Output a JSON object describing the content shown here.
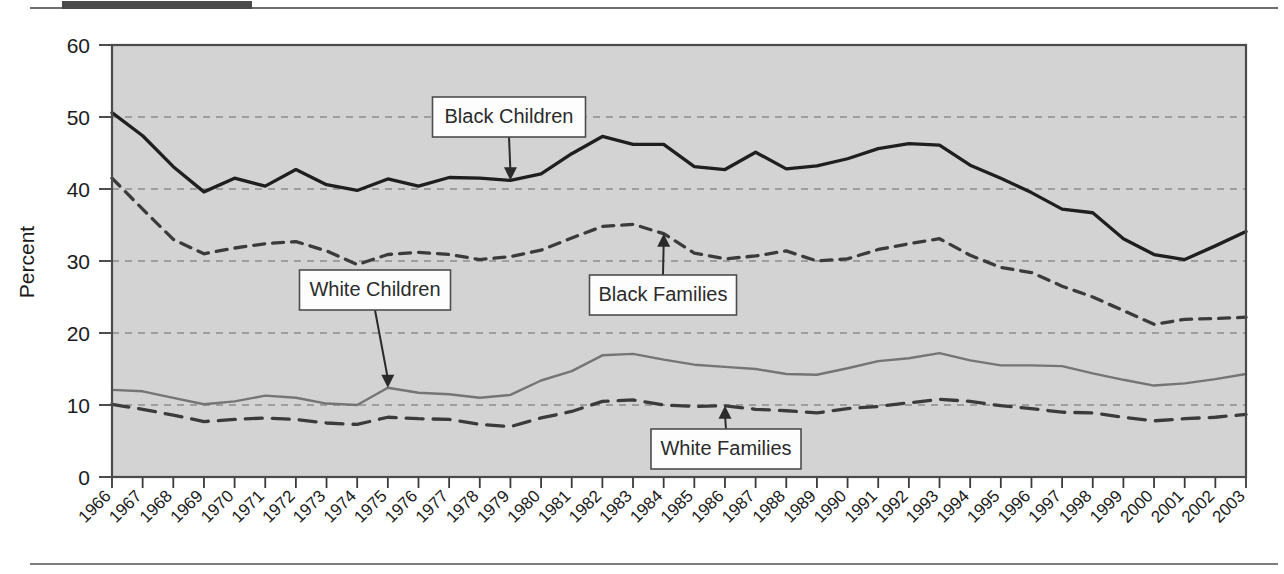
{
  "figure": {
    "percent_axis_label": "Percent",
    "background_color": "#d3d3d3",
    "frame_color": "#4a4a4a"
  },
  "chart_data": {
    "type": "line",
    "title": "",
    "xlabel": "",
    "ylabel": "Percent",
    "ylim": [
      0,
      60
    ],
    "yticks": [
      0,
      10,
      20,
      30,
      40,
      50,
      60
    ],
    "grid": "horizontal dashed gridlines at 10, 20, 30, 40, 50",
    "legend": "inline callout boxes with arrows",
    "x": [
      1966,
      1967,
      1968,
      1969,
      1970,
      1971,
      1972,
      1973,
      1974,
      1975,
      1976,
      1977,
      1978,
      1979,
      1980,
      1981,
      1982,
      1983,
      1984,
      1985,
      1986,
      1987,
      1988,
      1989,
      1990,
      1991,
      1992,
      1993,
      1994,
      1995,
      1996,
      1997,
      1998,
      1999,
      2000,
      2001,
      2002,
      2003
    ],
    "series": [
      {
        "name": "Black Children",
        "style": "solid",
        "color": "#1f1f1f",
        "values": [
          50.6,
          47.4,
          43.1,
          39.6,
          41.5,
          40.4,
          42.7,
          40.6,
          39.8,
          41.4,
          40.4,
          41.6,
          41.5,
          41.2,
          42.1,
          44.9,
          47.3,
          46.2,
          46.2,
          43.1,
          42.7,
          45.1,
          42.8,
          43.2,
          44.2,
          45.6,
          46.3,
          46.1,
          43.3,
          41.5,
          39.5,
          37.2,
          36.7,
          33.1,
          30.9,
          30.2,
          32.1,
          34.1
        ]
      },
      {
        "name": "Black Families",
        "style": "dashed",
        "color": "#3b3b3b",
        "values": [
          41.5,
          37.2,
          33.0,
          31.0,
          31.8,
          32.4,
          32.7,
          31.4,
          29.5,
          30.9,
          31.2,
          30.9,
          30.2,
          30.6,
          31.5,
          33.2,
          34.8,
          35.1,
          33.8,
          31.1,
          30.3,
          30.7,
          31.4,
          30.0,
          30.3,
          31.6,
          32.4,
          33.1,
          30.8,
          29.1,
          28.4,
          26.5,
          25.0,
          23.1,
          21.2,
          21.9,
          22.0,
          22.2
        ]
      },
      {
        "name": "White Children",
        "style": "solid",
        "color": "#757575",
        "values": [
          12.1,
          11.9,
          11.0,
          10.1,
          10.5,
          11.3,
          11.0,
          10.2,
          10.0,
          12.4,
          11.7,
          11.5,
          11.0,
          11.4,
          13.4,
          14.7,
          16.9,
          17.1,
          16.3,
          15.6,
          15.3,
          15.0,
          14.3,
          14.2,
          15.1,
          16.1,
          16.5,
          17.2,
          16.2,
          15.5,
          15.5,
          15.4,
          14.4,
          13.5,
          12.7,
          13.0,
          13.6,
          14.3
        ]
      },
      {
        "name": "White Families",
        "style": "dashed-long",
        "color": "#3b3b3b",
        "values": [
          10.1,
          9.4,
          8.6,
          7.7,
          8.0,
          8.2,
          8.0,
          7.5,
          7.3,
          8.3,
          8.1,
          8.0,
          7.3,
          7.0,
          8.2,
          9.1,
          10.5,
          10.7,
          10.0,
          9.8,
          9.9,
          9.4,
          9.2,
          8.9,
          9.5,
          9.8,
          10.3,
          10.8,
          10.5,
          9.9,
          9.5,
          9.0,
          8.9,
          8.3,
          7.8,
          8.1,
          8.3,
          8.7
        ]
      }
    ],
    "annotations": [
      {
        "label": "Black Children",
        "points_to_year": 1979,
        "points_to_value": 41.2,
        "arrow": "down"
      },
      {
        "label": "Black Families",
        "points_to_year": 1984,
        "points_to_value": 33.8,
        "arrow": "up"
      },
      {
        "label": "White Children",
        "points_to_year": 1975,
        "points_to_value": 12.4,
        "arrow": "down"
      },
      {
        "label": "White Families",
        "points_to_year": 1986,
        "points_to_value": 9.9,
        "arrow": "up"
      }
    ]
  }
}
